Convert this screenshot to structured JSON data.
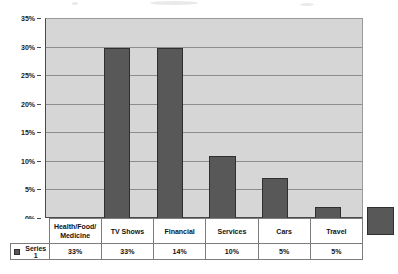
{
  "chart_data": {
    "type": "bar",
    "title": "",
    "subtitle": "",
    "xlabel": "",
    "ylabel": "",
    "categories": [
      "Health/Food/ Medicine",
      "TV Shows",
      "Financial",
      "Services",
      "Cars",
      "Travel"
    ],
    "category_lines": [
      [
        "Health/Food/",
        "Medicine"
      ],
      [
        "TV Shows"
      ],
      [
        "Financial"
      ],
      [
        "Services"
      ],
      [
        "Cars"
      ],
      [
        "Travel"
      ]
    ],
    "values": [
      33,
      33,
      14,
      10,
      5,
      5
    ],
    "value_labels": [
      "33%",
      "33%",
      "14%",
      "10%",
      "5%",
      "5%"
    ],
    "series": [
      {
        "name": "Series 1",
        "values": [
          33,
          33,
          14,
          10,
          5,
          5
        ]
      }
    ],
    "ylim": [
      0,
      35
    ],
    "ytick_values": [
      35,
      30,
      25,
      20,
      15,
      10,
      5,
      0
    ],
    "ytick_labels": [
      "35%",
      "30%",
      "25%",
      "20%",
      "15%",
      "10%",
      "5%",
      "0%"
    ],
    "grid": true,
    "legend_position": "data-table-left",
    "data_table_visible": true,
    "colors": {
      "bar_fill": "#585858",
      "bar_border": "#2f2f2f",
      "plot_background": "#d6d6d6",
      "gridline": "#8d8d8d",
      "axis": "#4a4a4a",
      "page_background": "#ffffff",
      "text": "#121212"
    }
  },
  "legend": {
    "swatch_name": "series-1-swatch",
    "label": "Series 1"
  },
  "data_table": {
    "header_row_label": "",
    "columns": [
      "Health/Food/ Medicine",
      "TV Shows",
      "Financial",
      "Services",
      "Cars",
      "Travel"
    ],
    "rows": [
      {
        "label": "Series 1",
        "cells": [
          "33%",
          "33%",
          "14%",
          "10%",
          "5%",
          "5%"
        ]
      }
    ]
  }
}
